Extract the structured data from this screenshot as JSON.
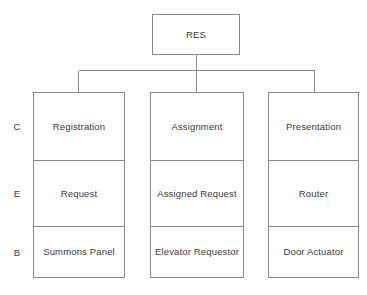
{
  "diagram": {
    "title_node": {
      "label": "RES",
      "name": "res-root-node"
    },
    "row_labels": [
      {
        "key": "C",
        "label": "C"
      },
      {
        "key": "E",
        "label": "E"
      },
      {
        "key": "B",
        "label": "B"
      }
    ],
    "columns": [
      {
        "name": "registration-column",
        "cells": [
          {
            "label": "Registration"
          },
          {
            "label": "Request"
          },
          {
            "label": "Summons Panel"
          }
        ]
      },
      {
        "name": "assignment-column",
        "cells": [
          {
            "label": "Assignment"
          },
          {
            "label": "Assigned Request"
          },
          {
            "label": "Elevator Requestor"
          }
        ]
      },
      {
        "name": "presentation-column",
        "cells": [
          {
            "label": "Presentation"
          },
          {
            "label": "Router"
          },
          {
            "label": "Door Actuator"
          }
        ]
      }
    ],
    "colors": {
      "stroke": "#8a8a8a",
      "text": "#3a3a3a",
      "background": "#ffffff"
    }
  }
}
